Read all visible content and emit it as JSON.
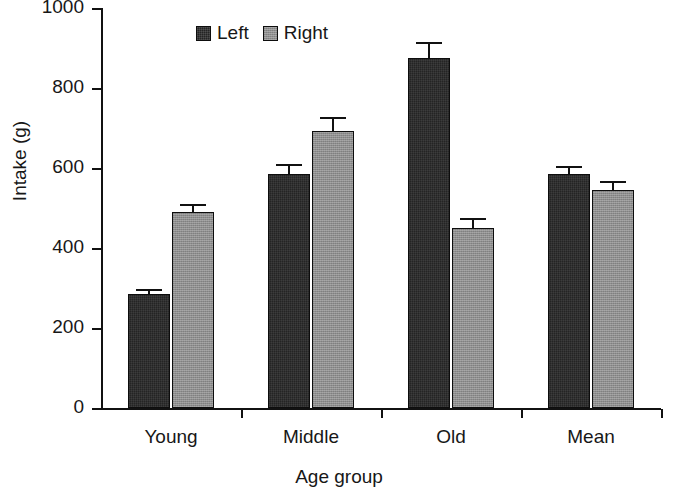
{
  "chart_data": {
    "type": "bar",
    "title": "",
    "xlabel": "Age group",
    "ylabel": "Intake (g)",
    "categories": [
      "Young",
      "Middle",
      "Old",
      "Mean"
    ],
    "ylim": [
      0,
      1000
    ],
    "yticks": [
      0,
      200,
      400,
      600,
      800,
      1000
    ],
    "ytick_labels": [
      "0",
      "200",
      "400",
      "600",
      "800",
      "1000"
    ],
    "grid": false,
    "legend_position": "top-center",
    "series": [
      {
        "name": "Left",
        "color": "#242424",
        "values": [
          285,
          585,
          875,
          585
        ],
        "errors": [
          12,
          25,
          40,
          20
        ]
      },
      {
        "name": "Right",
        "color": "#8e8e8e",
        "values": [
          490,
          693,
          450,
          545
        ],
        "errors": [
          20,
          35,
          25,
          22
        ]
      }
    ]
  }
}
